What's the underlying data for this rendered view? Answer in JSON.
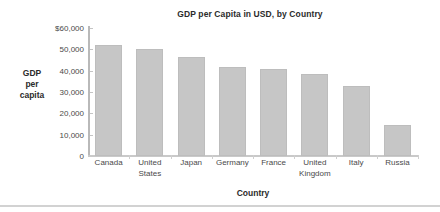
{
  "chart_data": {
    "type": "bar",
    "title": "GDP per Capita in USD, by Country",
    "xlabel": "Country",
    "ylabel": "GDP per capita",
    "ylabel_lines": [
      "GDP",
      "per",
      "capita"
    ],
    "categories": [
      "Canada",
      "United States",
      "Japan",
      "Germany",
      "France",
      "United Kingdom",
      "Italy",
      "Russia"
    ],
    "category_lines": [
      [
        "Canada"
      ],
      [
        "United",
        "States"
      ],
      [
        "Japan"
      ],
      [
        "Germany"
      ],
      [
        "France"
      ],
      [
        "United",
        "Kingdom"
      ],
      [
        "Italy"
      ],
      [
        "Russia"
      ]
    ],
    "values": [
      52000,
      50000,
      46500,
      41500,
      41000,
      38500,
      33000,
      14500
    ],
    "ylim": [
      0,
      60000
    ],
    "ytick_values": [
      60000,
      50000,
      40000,
      30000,
      20000,
      10000,
      0
    ],
    "ytick_labels": [
      "$60,000",
      "50,000",
      "40,000",
      "30,000",
      "20,000",
      "10,000",
      "0"
    ],
    "grid": false,
    "legend": "none",
    "bar_color": "#c6c6c6",
    "bar_border_color": "#bdbdbd",
    "axis_color": "#c2c2c2",
    "text_color": "#4a4a4a"
  }
}
